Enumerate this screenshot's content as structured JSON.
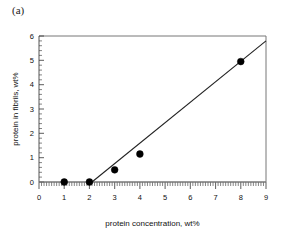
{
  "panel": {
    "label": "(a)"
  },
  "chart_data": {
    "type": "scatter",
    "title": "",
    "panel_label": "(a)",
    "xlabel": "protein concentration, wt%",
    "ylabel": "protein in fibrils, wt%",
    "xlim": [
      0,
      9
    ],
    "ylim": [
      0,
      6
    ],
    "xticks": [
      0,
      1,
      2,
      3,
      4,
      5,
      6,
      7,
      8,
      9
    ],
    "yticks": [
      0,
      1,
      2,
      3,
      4,
      5,
      6
    ],
    "xtick_labels": [
      "0",
      "1",
      "2",
      "3",
      "4",
      "5",
      "6",
      "7",
      "8",
      "9"
    ],
    "ytick_labels": [
      "0",
      "1",
      "2",
      "3",
      "4",
      "5",
      "6"
    ],
    "x_minor_tick_interval": 0.1,
    "y_minor_tick_interval": 0.2,
    "grid": false,
    "legend": null,
    "marker": "filled-circle",
    "marker_color": "#000000",
    "line_color": "#222222",
    "x": [
      1,
      2,
      3,
      4,
      8
    ],
    "y": [
      0,
      0,
      0.5,
      1.15,
      4.95
    ],
    "series": [
      {
        "name": "protein in fibrils",
        "points": [
          {
            "x": 1,
            "y": 0
          },
          {
            "x": 2,
            "y": 0
          },
          {
            "x": 3,
            "y": 0.5
          },
          {
            "x": 4,
            "y": 1.15
          },
          {
            "x": 8,
            "y": 4.95
          }
        ]
      }
    ],
    "annotations": [
      {
        "type": "fit-line",
        "name": "regression-line",
        "x_start": 2.1,
        "y_start": 0,
        "x_end": 9,
        "y_end": 5.8,
        "x_intercept": 2.1,
        "slope": 0.84
      },
      {
        "type": "baseline",
        "name": "zero-baseline",
        "y": 0,
        "x_start": 0,
        "x_end": 9
      }
    ]
  }
}
